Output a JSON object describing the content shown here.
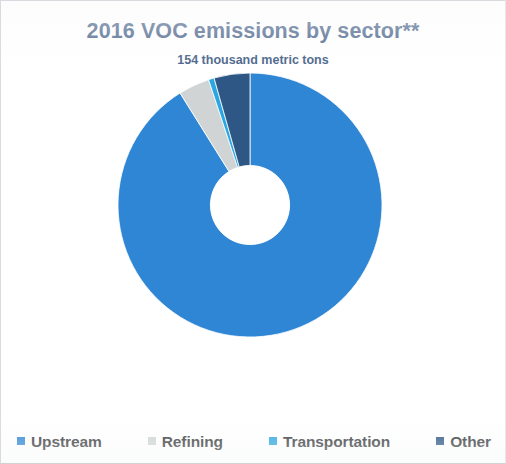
{
  "chart_data": {
    "type": "pie",
    "variant": "donut",
    "title": "2016 VOC emissions by sector**",
    "subtitle": "154 thousand metric tons",
    "unit": "thousand metric tons",
    "total": 154,
    "categories": [
      "Upstream",
      "Refining",
      "Transportation",
      "Other"
    ],
    "values": [
      86.5,
      3.8,
      0.7,
      9.0
    ],
    "value_unit": "percent",
    "colors": [
      "#2f86d4",
      "#d0d4d5",
      "#2aa7e0",
      "#2e5785"
    ],
    "series": [
      {
        "name": "2016 VOC emissions by sector",
        "values": [
          86.5,
          3.8,
          0.7,
          9.0
        ]
      }
    ],
    "slices": [
      {
        "label": "Upstream",
        "value": 86.5,
        "color": "#2f86d4",
        "start_angle": 32.0,
        "end_angle": 360.0
      },
      {
        "label": "Refining",
        "value": 3.8,
        "color": "#d0d4d5",
        "start_angle": 18.3,
        "end_angle": 32.0
      },
      {
        "label": "Transportation",
        "value": 0.7,
        "color": "#2aa7e0",
        "start_angle": 15.8,
        "end_angle": 18.3
      },
      {
        "label": "Other",
        "value": 9.0,
        "color": "#2e5785",
        "start_angle": 0.0,
        "end_angle": 15.8
      }
    ],
    "start_angle_deg": 0,
    "direction": "counterclockwise",
    "inner_radius_ratio": 0.3,
    "grid": false,
    "legend_position": "bottom",
    "data_labels": false,
    "xlabel": "",
    "ylabel": ""
  },
  "legend": {
    "items": [
      {
        "label": "Upstream",
        "color": "#2f86d4"
      },
      {
        "label": "Refining",
        "color": "#d0d4d5"
      },
      {
        "label": "Transportation",
        "color": "#2aa7e0"
      },
      {
        "label": "Other",
        "color": "#2e5785"
      }
    ]
  },
  "theme": {
    "title_color": "#4d678c",
    "legend_text_color": "#37393b",
    "background": "#ffffff",
    "border_color": "#d9dcdf"
  }
}
